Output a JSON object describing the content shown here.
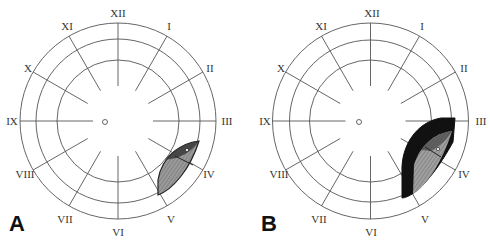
{
  "figure": {
    "panels": [
      {
        "letter": "A",
        "clock_labels": [
          "XII",
          "I",
          "II",
          "III",
          "IV",
          "V",
          "VI",
          "VII",
          "VIII",
          "IX",
          "X",
          "XI"
        ],
        "lesion": "gray spindle-shaped lesion between clock hours III-IV and V, in peripheral ring"
      },
      {
        "letter": "B",
        "clock_labels": [
          "XII",
          "I",
          "II",
          "III",
          "IV",
          "V",
          "VI",
          "VII",
          "VIII",
          "IX",
          "X",
          "XI"
        ],
        "lesion": "larger lesion between III and V with black border surrounding gray center"
      }
    ],
    "colors": {
      "lines": "#555555",
      "lesion_gray": "#8a8a8a",
      "lesion_dark": "#111111",
      "background": "#ffffff"
    }
  }
}
